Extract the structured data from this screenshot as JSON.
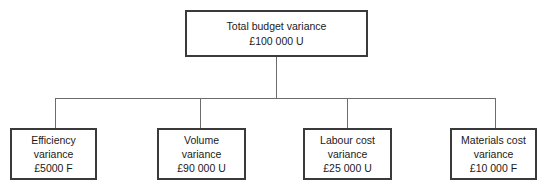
{
  "diagram": {
    "type": "hierarchy-tree",
    "background_color": "#ffffff",
    "box_border_color": "#3a3a3a",
    "connector_color": "#6b6b6b",
    "root": {
      "title": "Total budget variance",
      "value": "£100 000 U"
    },
    "children": [
      {
        "title_line1": "Efficiency",
        "title_line2": "variance",
        "value": "£5000 F"
      },
      {
        "title_line1": "Volume",
        "title_line2": "variance",
        "value": "£90 000 U"
      },
      {
        "title_line1": "Labour cost",
        "title_line2": "variance",
        "value": "£25 000 U"
      },
      {
        "title_line1": "Materials cost",
        "title_line2": "variance",
        "value": "£10 000 F"
      }
    ]
  }
}
